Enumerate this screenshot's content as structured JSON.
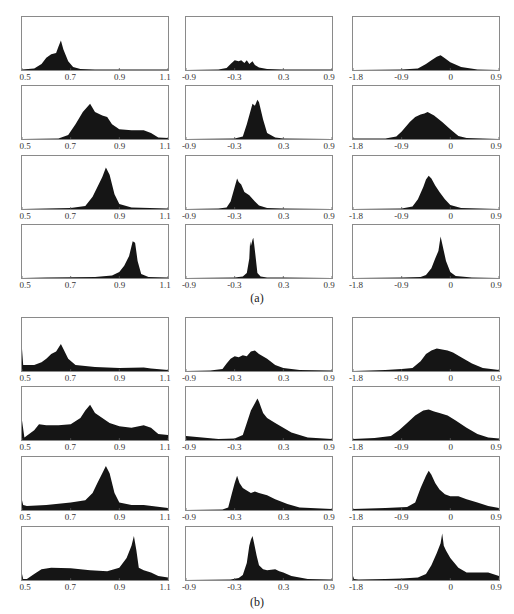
{
  "figure": {
    "caption_a": "(a)",
    "caption_b": "(b)"
  },
  "axes": {
    "col1": {
      "ticks": [
        "0.5",
        "0.7",
        "0.9",
        "1.1"
      ],
      "min": 0.5,
      "max": 1.1
    },
    "col2": {
      "ticks": [
        "-0.9",
        "-0.3",
        "0.3",
        "0.9"
      ],
      "min": -0.9,
      "max": 0.9
    },
    "col3": {
      "ticks": [
        "-1.8",
        "-0.9",
        "0",
        "0.9"
      ],
      "min": -1.8,
      "max": 0.9
    }
  },
  "chart_data": [
    {
      "type": "area",
      "title": "(a)",
      "description": "4x3 grid of histograms (filled density), rows = stages, columns = three different value ranges",
      "panels": [
        {
          "row": 0,
          "col": 0,
          "xlim": [
            0.5,
            1.1
          ],
          "x": [
            0.5,
            0.55,
            0.58,
            0.6,
            0.62,
            0.64,
            0.65,
            0.66,
            0.67,
            0.69,
            0.71,
            0.74,
            0.8,
            1.1
          ],
          "y": [
            0.01,
            0.03,
            0.12,
            0.25,
            0.32,
            0.35,
            0.48,
            0.6,
            0.42,
            0.18,
            0.06,
            0.02,
            0.01,
            0.01
          ]
        },
        {
          "row": 0,
          "col": 1,
          "xlim": [
            -0.9,
            0.9
          ],
          "x": [
            -0.9,
            -0.5,
            -0.4,
            -0.35,
            -0.3,
            -0.25,
            -0.22,
            -0.18,
            -0.15,
            -0.12,
            -0.08,
            -0.05,
            0.0,
            0.1,
            0.3,
            0.9
          ],
          "y": [
            0.0,
            0.01,
            0.04,
            0.12,
            0.2,
            0.18,
            0.2,
            0.14,
            0.2,
            0.12,
            0.18,
            0.1,
            0.05,
            0.02,
            0.01,
            0.01
          ]
        },
        {
          "row": 0,
          "col": 2,
          "xlim": [
            -1.8,
            0.9
          ],
          "x": [
            -1.8,
            -0.9,
            -0.6,
            -0.45,
            -0.35,
            -0.25,
            -0.18,
            -0.1,
            0.0,
            0.2,
            0.5,
            0.9
          ],
          "y": [
            0.0,
            0.01,
            0.03,
            0.12,
            0.2,
            0.27,
            0.3,
            0.24,
            0.16,
            0.06,
            0.01,
            0.0
          ]
        },
        {
          "row": 1,
          "col": 0,
          "xlim": [
            0.5,
            1.1
          ],
          "x": [
            0.5,
            0.65,
            0.69,
            0.72,
            0.75,
            0.78,
            0.8,
            0.83,
            0.85,
            0.87,
            0.9,
            0.95,
            1.0,
            1.03,
            1.06,
            1.1
          ],
          "y": [
            0.0,
            0.01,
            0.08,
            0.3,
            0.55,
            0.72,
            0.55,
            0.48,
            0.45,
            0.3,
            0.2,
            0.18,
            0.18,
            0.12,
            0.03,
            0.02
          ]
        },
        {
          "row": 1,
          "col": 1,
          "xlim": [
            -0.9,
            0.9
          ],
          "x": [
            -0.9,
            -0.3,
            -0.2,
            -0.15,
            -0.1,
            -0.08,
            -0.05,
            -0.02,
            0.0,
            0.05,
            0.1,
            0.2,
            0.3,
            0.9
          ],
          "y": [
            0.0,
            0.01,
            0.05,
            0.3,
            0.6,
            0.72,
            0.68,
            0.8,
            0.75,
            0.4,
            0.12,
            0.03,
            0.01,
            0.0
          ]
        },
        {
          "row": 1,
          "col": 2,
          "xlim": [
            -1.8,
            0.9
          ],
          "x": [
            -1.8,
            -1.2,
            -1.0,
            -0.9,
            -0.75,
            -0.65,
            -0.55,
            -0.48,
            -0.42,
            -0.3,
            -0.15,
            0.0,
            0.15,
            0.3,
            0.9
          ],
          "y": [
            0.01,
            0.01,
            0.05,
            0.15,
            0.35,
            0.45,
            0.5,
            0.52,
            0.55,
            0.48,
            0.35,
            0.2,
            0.06,
            0.02,
            0.0
          ]
        },
        {
          "row": 2,
          "col": 0,
          "xlim": [
            0.5,
            1.1
          ],
          "x": [
            0.5,
            0.6,
            0.7,
            0.76,
            0.79,
            0.81,
            0.83,
            0.845,
            0.86,
            0.88,
            0.9,
            0.95,
            1.1
          ],
          "y": [
            0.0,
            0.01,
            0.02,
            0.06,
            0.25,
            0.45,
            0.65,
            0.85,
            0.7,
            0.3,
            0.1,
            0.03,
            0.01
          ]
        },
        {
          "row": 2,
          "col": 1,
          "xlim": [
            -0.9,
            0.9
          ],
          "x": [
            -0.9,
            -0.5,
            -0.4,
            -0.35,
            -0.3,
            -0.27,
            -0.25,
            -0.22,
            -0.18,
            -0.12,
            -0.05,
            0.0,
            0.1,
            0.3,
            0.9
          ],
          "y": [
            0.0,
            0.01,
            0.03,
            0.15,
            0.45,
            0.62,
            0.55,
            0.5,
            0.35,
            0.28,
            0.15,
            0.07,
            0.02,
            0.01,
            0.0
          ]
        },
        {
          "row": 2,
          "col": 2,
          "xlim": [
            -1.8,
            0.9
          ],
          "x": [
            -1.8,
            -0.9,
            -0.7,
            -0.6,
            -0.5,
            -0.45,
            -0.4,
            -0.35,
            -0.28,
            -0.2,
            -0.1,
            0.0,
            0.2,
            0.9
          ],
          "y": [
            0.0,
            0.01,
            0.05,
            0.2,
            0.45,
            0.6,
            0.68,
            0.62,
            0.48,
            0.35,
            0.2,
            0.08,
            0.02,
            0.0
          ]
        },
        {
          "row": 3,
          "col": 0,
          "xlim": [
            0.5,
            1.1
          ],
          "x": [
            0.5,
            0.6,
            0.8,
            0.87,
            0.9,
            0.92,
            0.94,
            0.955,
            0.965,
            0.975,
            0.99,
            1.02,
            1.1
          ],
          "y": [
            0.0,
            0.01,
            0.02,
            0.05,
            0.12,
            0.25,
            0.45,
            0.75,
            0.72,
            0.35,
            0.08,
            0.02,
            0.01
          ]
        },
        {
          "row": 3,
          "col": 1,
          "xlim": [
            -0.9,
            0.9
          ],
          "x": [
            -0.9,
            -0.3,
            -0.2,
            -0.15,
            -0.12,
            -0.11,
            -0.1,
            -0.08,
            -0.07,
            -0.06,
            -0.04,
            -0.02,
            0.02,
            0.1,
            0.3,
            0.9
          ],
          "y": [
            0.0,
            0.01,
            0.03,
            0.1,
            0.4,
            0.75,
            0.65,
            0.78,
            0.82,
            0.7,
            0.4,
            0.1,
            0.03,
            0.01,
            0.01,
            0.0
          ]
        },
        {
          "row": 3,
          "col": 2,
          "xlim": [
            -1.8,
            0.9
          ],
          "x": [
            -1.8,
            -0.9,
            -0.55,
            -0.45,
            -0.35,
            -0.28,
            -0.22,
            -0.18,
            -0.15,
            -0.12,
            -0.08,
            0.0,
            0.1,
            0.4,
            0.9
          ],
          "y": [
            0.0,
            0.01,
            0.02,
            0.06,
            0.2,
            0.4,
            0.55,
            0.85,
            0.7,
            0.55,
            0.35,
            0.12,
            0.04,
            0.01,
            0.0
          ]
        }
      ]
    },
    {
      "type": "area",
      "title": "(b)",
      "description": "4x3 grid of histograms (filled density) with heavier tails",
      "panels": [
        {
          "row": 0,
          "col": 0,
          "xlim": [
            0.5,
            1.1
          ],
          "x": [
            0.5,
            0.505,
            0.52,
            0.55,
            0.58,
            0.6,
            0.62,
            0.64,
            0.66,
            0.67,
            0.69,
            0.72,
            0.8,
            0.9,
            1.0,
            1.03,
            1.1
          ],
          "y": [
            0.45,
            0.12,
            0.12,
            0.12,
            0.18,
            0.25,
            0.35,
            0.4,
            0.55,
            0.45,
            0.25,
            0.12,
            0.08,
            0.06,
            0.07,
            0.05,
            0.02
          ]
        },
        {
          "row": 0,
          "col": 1,
          "xlim": [
            -0.9,
            0.9
          ],
          "x": [
            -0.9,
            -0.6,
            -0.45,
            -0.4,
            -0.35,
            -0.3,
            -0.25,
            -0.2,
            -0.15,
            -0.1,
            -0.05,
            0.0,
            0.1,
            0.2,
            0.3,
            0.5,
            0.9
          ],
          "y": [
            0.0,
            0.01,
            0.04,
            0.15,
            0.25,
            0.3,
            0.28,
            0.32,
            0.3,
            0.4,
            0.42,
            0.35,
            0.25,
            0.12,
            0.06,
            0.02,
            0.01
          ]
        },
        {
          "row": 0,
          "col": 2,
          "xlim": [
            -1.8,
            0.9
          ],
          "x": [
            -1.8,
            -1.2,
            -0.9,
            -0.7,
            -0.55,
            -0.45,
            -0.35,
            -0.25,
            -0.15,
            -0.05,
            0.05,
            0.2,
            0.4,
            0.6,
            0.9
          ],
          "y": [
            0.0,
            0.02,
            0.04,
            0.06,
            0.2,
            0.35,
            0.42,
            0.46,
            0.44,
            0.42,
            0.38,
            0.28,
            0.15,
            0.06,
            0.02
          ]
        },
        {
          "row": 1,
          "col": 0,
          "xlim": [
            0.5,
            1.1
          ],
          "x": [
            0.5,
            0.51,
            0.55,
            0.57,
            0.6,
            0.65,
            0.7,
            0.74,
            0.76,
            0.78,
            0.8,
            0.83,
            0.86,
            0.9,
            0.95,
            1.0,
            1.03,
            1.06,
            1.1
          ],
          "y": [
            0.4,
            0.05,
            0.2,
            0.32,
            0.3,
            0.3,
            0.32,
            0.45,
            0.6,
            0.72,
            0.55,
            0.45,
            0.35,
            0.28,
            0.25,
            0.3,
            0.25,
            0.12,
            0.1
          ]
        },
        {
          "row": 1,
          "col": 1,
          "xlim": [
            -0.9,
            0.9
          ],
          "x": [
            -0.9,
            -0.5,
            -0.3,
            -0.2,
            -0.15,
            -0.1,
            -0.05,
            -0.02,
            0.0,
            0.05,
            0.1,
            0.2,
            0.3,
            0.4,
            0.6,
            0.9
          ],
          "y": [
            0.08,
            0.02,
            0.03,
            0.1,
            0.35,
            0.6,
            0.75,
            0.85,
            0.78,
            0.55,
            0.45,
            0.35,
            0.25,
            0.15,
            0.05,
            0.02
          ]
        },
        {
          "row": 1,
          "col": 2,
          "xlim": [
            -1.8,
            0.9
          ],
          "x": [
            -1.8,
            -1.4,
            -1.1,
            -0.95,
            -0.8,
            -0.65,
            -0.5,
            -0.4,
            -0.3,
            -0.2,
            -0.05,
            0.1,
            0.3,
            0.5,
            0.7,
            0.9
          ],
          "y": [
            0.02,
            0.04,
            0.08,
            0.2,
            0.35,
            0.5,
            0.6,
            0.62,
            0.58,
            0.55,
            0.5,
            0.4,
            0.25,
            0.12,
            0.05,
            0.03
          ]
        },
        {
          "row": 2,
          "col": 0,
          "xlim": [
            0.5,
            1.1
          ],
          "x": [
            0.5,
            0.505,
            0.52,
            0.6,
            0.7,
            0.76,
            0.79,
            0.81,
            0.83,
            0.845,
            0.86,
            0.88,
            0.9,
            0.95,
            1.0,
            1.05,
            1.1
          ],
          "y": [
            0.2,
            0.1,
            0.08,
            0.1,
            0.15,
            0.2,
            0.35,
            0.55,
            0.75,
            0.9,
            0.75,
            0.35,
            0.15,
            0.1,
            0.1,
            0.07,
            0.04
          ]
        },
        {
          "row": 2,
          "col": 1,
          "xlim": [
            -0.9,
            0.9
          ],
          "x": [
            -0.9,
            -0.45,
            -0.38,
            -0.34,
            -0.3,
            -0.27,
            -0.24,
            -0.2,
            -0.15,
            -0.1,
            -0.05,
            0.0,
            0.1,
            0.2,
            0.35,
            0.5,
            0.9
          ],
          "y": [
            0.0,
            0.01,
            0.05,
            0.3,
            0.55,
            0.7,
            0.55,
            0.45,
            0.4,
            0.35,
            0.38,
            0.35,
            0.3,
            0.22,
            0.12,
            0.05,
            0.02
          ]
        },
        {
          "row": 2,
          "col": 2,
          "xlim": [
            -1.8,
            0.9
          ],
          "x": [
            -1.8,
            -1.2,
            -0.8,
            -0.65,
            -0.55,
            -0.45,
            -0.4,
            -0.35,
            -0.28,
            -0.2,
            -0.1,
            0.0,
            0.15,
            0.3,
            0.5,
            0.7,
            0.9
          ],
          "y": [
            0.02,
            0.04,
            0.06,
            0.15,
            0.45,
            0.7,
            0.8,
            0.72,
            0.55,
            0.42,
            0.32,
            0.28,
            0.28,
            0.22,
            0.15,
            0.08,
            0.04
          ]
        },
        {
          "row": 3,
          "col": 0,
          "xlim": [
            0.5,
            1.1
          ],
          "x": [
            0.5,
            0.505,
            0.52,
            0.55,
            0.58,
            0.62,
            0.7,
            0.78,
            0.85,
            0.9,
            0.93,
            0.95,
            0.96,
            0.97,
            0.98,
            1.0,
            1.03,
            1.06,
            1.1
          ],
          "y": [
            0.12,
            0.02,
            0.02,
            0.12,
            0.22,
            0.25,
            0.24,
            0.2,
            0.18,
            0.25,
            0.45,
            0.7,
            0.9,
            0.6,
            0.25,
            0.2,
            0.15,
            0.08,
            0.05
          ]
        },
        {
          "row": 3,
          "col": 1,
          "xlim": [
            -0.9,
            0.9
          ],
          "x": [
            -0.9,
            -0.35,
            -0.25,
            -0.2,
            -0.15,
            -0.12,
            -0.1,
            -0.08,
            -0.06,
            -0.03,
            0.0,
            0.05,
            0.1,
            0.2,
            0.25,
            0.3,
            0.4,
            0.6,
            0.9
          ],
          "y": [
            0.0,
            0.01,
            0.04,
            0.1,
            0.35,
            0.7,
            0.82,
            0.9,
            0.75,
            0.5,
            0.3,
            0.22,
            0.2,
            0.22,
            0.18,
            0.15,
            0.08,
            0.02,
            0.01
          ]
        },
        {
          "row": 3,
          "col": 2,
          "xlim": [
            -1.8,
            0.9
          ],
          "x": [
            -1.8,
            -1.78,
            -1.7,
            -1.2,
            -0.9,
            -0.6,
            -0.45,
            -0.35,
            -0.25,
            -0.18,
            -0.15,
            -0.12,
            -0.08,
            0.0,
            0.15,
            0.3,
            0.5,
            0.7,
            0.9
          ],
          "y": [
            0.08,
            0.02,
            0.01,
            0.02,
            0.03,
            0.05,
            0.12,
            0.3,
            0.55,
            0.75,
            0.95,
            0.7,
            0.6,
            0.45,
            0.25,
            0.15,
            0.15,
            0.15,
            0.08
          ]
        }
      ]
    }
  ]
}
